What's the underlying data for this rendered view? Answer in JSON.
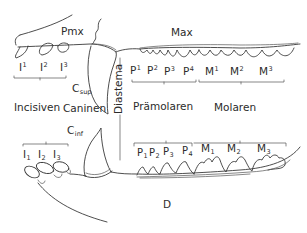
{
  "diagram": {
    "type": "dentition-schematic",
    "colors": {
      "line": "#3a3a3a",
      "text": "#2b2b2b",
      "background": "#ffffff"
    },
    "bones": {
      "premaxilla": "Pmx",
      "maxilla": "Max",
      "dentary": "D"
    },
    "regions": {
      "diastema": "Diastema",
      "incisors": "Incisiven",
      "canines": "Caninen",
      "premolars": "Prämolaren",
      "molars": "Molaren"
    },
    "canine_labels": {
      "upper": {
        "base": "C",
        "sub": "sup"
      },
      "lower": {
        "base": "C",
        "sub": "inf"
      }
    },
    "upper_teeth": [
      {
        "base": "I",
        "sup": "1"
      },
      {
        "base": "I",
        "sup": "2"
      },
      {
        "base": "I",
        "sup": "3"
      },
      {
        "base": "P",
        "sup": "1"
      },
      {
        "base": "P",
        "sup": "2"
      },
      {
        "base": "P",
        "sup": "3"
      },
      {
        "base": "P",
        "sup": "4"
      },
      {
        "base": "M",
        "sup": "1"
      },
      {
        "base": "M",
        "sup": "2"
      },
      {
        "base": "M",
        "sup": "3"
      }
    ],
    "lower_teeth": [
      {
        "base": "I",
        "sub": "1"
      },
      {
        "base": "I",
        "sub": "2"
      },
      {
        "base": "I",
        "sub": "3"
      },
      {
        "base": "P",
        "sub": "1"
      },
      {
        "base": "P",
        "sub": "2"
      },
      {
        "base": "P",
        "sub": "3"
      },
      {
        "base": "P",
        "sub": "4"
      },
      {
        "base": "M",
        "sub": "1"
      },
      {
        "base": "M",
        "sub": "2"
      },
      {
        "base": "M",
        "sub": "3"
      }
    ]
  }
}
